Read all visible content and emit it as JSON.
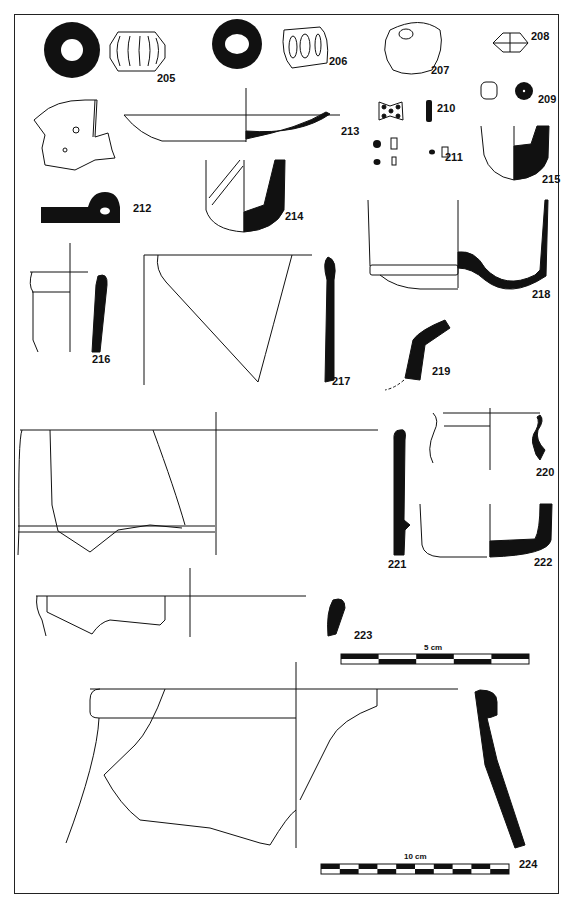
{
  "plate": {
    "frame_color": "#222222",
    "ink_color": "#111111",
    "catalog_numbers": [
      {
        "id": "205",
        "x": 157,
        "y": 80
      },
      {
        "id": "206",
        "x": 329,
        "y": 63
      },
      {
        "id": "207",
        "x": 431,
        "y": 72
      },
      {
        "id": "208",
        "x": 531,
        "y": 38
      },
      {
        "id": "209",
        "x": 538,
        "y": 101
      },
      {
        "id": "210",
        "x": 437,
        "y": 110
      },
      {
        "id": "211",
        "x": 445,
        "y": 159
      },
      {
        "id": "212",
        "x": 133,
        "y": 210
      },
      {
        "id": "213",
        "x": 341,
        "y": 133
      },
      {
        "id": "214",
        "x": 285,
        "y": 218
      },
      {
        "id": "215",
        "x": 542,
        "y": 181
      },
      {
        "id": "216",
        "x": 92,
        "y": 361
      },
      {
        "id": "217",
        "x": 332,
        "y": 383
      },
      {
        "id": "218",
        "x": 532,
        "y": 296
      },
      {
        "id": "219",
        "x": 432,
        "y": 373
      },
      {
        "id": "220",
        "x": 536,
        "y": 474
      },
      {
        "id": "221",
        "x": 388,
        "y": 566
      },
      {
        "id": "222",
        "x": 534,
        "y": 564
      },
      {
        "id": "223",
        "x": 354,
        "y": 637
      },
      {
        "id": "224",
        "x": 519,
        "y": 866
      }
    ],
    "scale_bars": [
      {
        "label": "5 cm",
        "x": 341,
        "y": 652,
        "width": 188,
        "segments": 5
      },
      {
        "label": "10 cm",
        "x": 321,
        "y": 862,
        "width": 188,
        "segments": 10
      }
    ]
  }
}
